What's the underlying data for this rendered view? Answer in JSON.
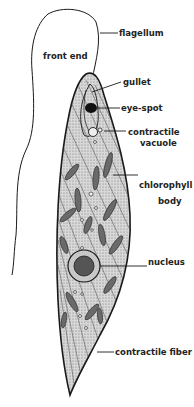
{
  "diagram": {
    "labels": {
      "front_end": "front end",
      "flagellum": "flagellum",
      "gullet": "gullet",
      "eye_spot": "eye-spot",
      "contractile_vacuole_1": "contractile",
      "contractile_vacuole_2": "vacuole",
      "chlorophyll_body_1": "chlorophyll",
      "chlorophyll_body_2": "body",
      "nucleus": "nucleus",
      "contractile_fiber": "contractile fiber"
    },
    "colors": {
      "outline": "#1a1a1a",
      "body_fill": "#cfcfcf",
      "chloroplast": "#6a6a6a",
      "eye_spot": "#111111",
      "background": "#ffffff"
    }
  }
}
